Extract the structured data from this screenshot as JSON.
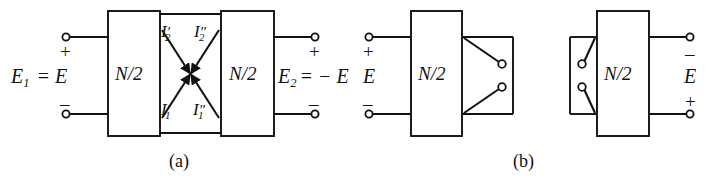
{
  "figure": {
    "type": "circuit-diagram",
    "line_color": "#121212",
    "background_color": "#ffffff",
    "width": 708,
    "height": 183
  },
  "captions": {
    "a": "(a)",
    "b": "(b)"
  },
  "panel_a": {
    "left_terminal_block": {
      "plus_sign": "+",
      "minus_sign": "–",
      "voltage_label_main": "E",
      "voltage_label_sub": "1",
      "voltage_label_rest": "= E"
    },
    "right_terminal_block": {
      "plus_sign": "+",
      "minus_sign": "–",
      "voltage_label_main": "E",
      "voltage_label_sub": "2",
      "voltage_label_rest": "= − E"
    },
    "boxes": [
      {
        "label_num": "N",
        "label_div": "/2"
      },
      {
        "label_num": "N",
        "label_div": "/2"
      }
    ],
    "currents": [
      {
        "symbol": "I",
        "sub": "2",
        "prime": "′",
        "name": "I2-prime"
      },
      {
        "symbol": "I",
        "sub": "2",
        "prime": "″",
        "name": "I2-double-prime"
      },
      {
        "symbol": "I",
        "sub": "1",
        "prime": "′",
        "name": "I1-prime"
      },
      {
        "symbol": "I",
        "sub": "1",
        "prime": "″",
        "name": "I1-double-prime"
      }
    ]
  },
  "panel_b": {
    "left_unit": {
      "plus_sign": "+",
      "minus_sign": "–",
      "voltage_label": "E",
      "box_label_num": "N",
      "box_label_div": "/2",
      "switch_count": 2
    },
    "right_unit": {
      "minus_sign": "–",
      "plus_sign": "+",
      "voltage_label": "E",
      "box_label_num": "N",
      "box_label_div": "/2",
      "switch_count": 2
    }
  }
}
